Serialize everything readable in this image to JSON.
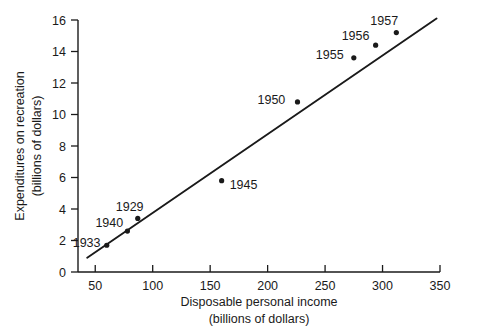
{
  "chart_data": {
    "type": "scatter",
    "title": "",
    "xlabel": "Disposable personal income",
    "xlabel_units": "(billions of dollars)",
    "ylabel": "Expenditures on recreation",
    "ylabel_units": "(billions of dollars)",
    "xlim": [
      35,
      350
    ],
    "ylim": [
      0,
      16
    ],
    "xticks": [
      50,
      100,
      150,
      200,
      250,
      300,
      350
    ],
    "yticks": [
      0,
      2,
      4,
      6,
      8,
      10,
      12,
      14,
      16
    ],
    "grid": false,
    "legend": "none",
    "point_color": "#1a1a1a",
    "line_color": "#1a1a1a",
    "points": [
      {
        "label": "1933",
        "x": 60,
        "y": 1.7,
        "label_dx": -34,
        "label_dy": -3
      },
      {
        "label": "1940",
        "x": 78,
        "y": 2.6,
        "label_dx": -32,
        "label_dy": -9
      },
      {
        "label": "1929",
        "x": 87,
        "y": 3.4,
        "label_dx": -22,
        "label_dy": -12
      },
      {
        "label": "1945",
        "x": 160,
        "y": 5.8,
        "label_dx": 8,
        "label_dy": 4
      },
      {
        "label": "1950",
        "x": 226,
        "y": 10.8,
        "label_dx": -40,
        "label_dy": -2
      },
      {
        "label": "1955",
        "x": 275,
        "y": 13.6,
        "label_dx": -38,
        "label_dy": -3
      },
      {
        "label": "1956",
        "x": 294,
        "y": 14.4,
        "label_dx": -34,
        "label_dy": -10
      },
      {
        "label": "1957",
        "x": 312,
        "y": 15.2,
        "label_dx": -26,
        "label_dy": -12
      }
    ],
    "fit_line": {
      "x_start": 43,
      "y_start": 0.9,
      "x_end": 347,
      "y_end": 16.1
    }
  }
}
